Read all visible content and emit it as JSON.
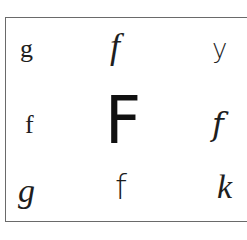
{
  "grid": {
    "rows": [
      [
        {
          "char": "g",
          "style": "serif-roman"
        },
        {
          "char": "f",
          "style": "italic-script"
        },
        {
          "char": "y",
          "style": "sans"
        }
      ],
      [
        {
          "char": "f",
          "style": "serif-roman"
        },
        {
          "char": "F",
          "style": "bold-sans-large"
        },
        {
          "char": "f",
          "style": "cursive-looped"
        }
      ],
      [
        {
          "char": "g",
          "style": "cursive-italic"
        },
        {
          "char": "f",
          "style": "descender-f"
        },
        {
          "char": "k",
          "style": "italic-script"
        }
      ]
    ]
  }
}
